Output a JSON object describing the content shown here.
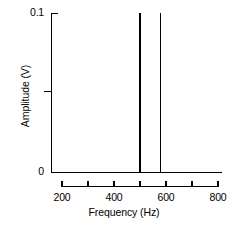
{
  "chart_data": {
    "type": "bar",
    "title": "",
    "subtitle": "",
    "xlabel": "Frequency (Hz)",
    "ylabel": "Amplitude (V)",
    "xlim": [
      200,
      800
    ],
    "ylim": [
      0,
      0.1
    ],
    "grid": false,
    "legend": null,
    "xticks": [
      200,
      300,
      400,
      500,
      600,
      700,
      800
    ],
    "xtick_labels": [
      "200",
      "",
      "400",
      "",
      "600",
      "",
      "800"
    ],
    "yticks": [
      0,
      0.05,
      0.1
    ],
    "ytick_labels": [
      "0",
      "",
      "0.1"
    ],
    "series": [
      {
        "name": "Spectrum",
        "x": [
          500,
          580
        ],
        "values": [
          0.1,
          0.1
        ]
      }
    ],
    "annotations": []
  },
  "axes": {
    "y_label_top": "0.1",
    "y_label_bottom": "0",
    "y_title": "Amplitude (V)",
    "x_title": "Frequency (Hz)",
    "x_labels": [
      "200",
      "400",
      "600",
      "800"
    ]
  },
  "colors": {
    "line": "#000000",
    "background": "#ffffff",
    "text": "#000000"
  }
}
